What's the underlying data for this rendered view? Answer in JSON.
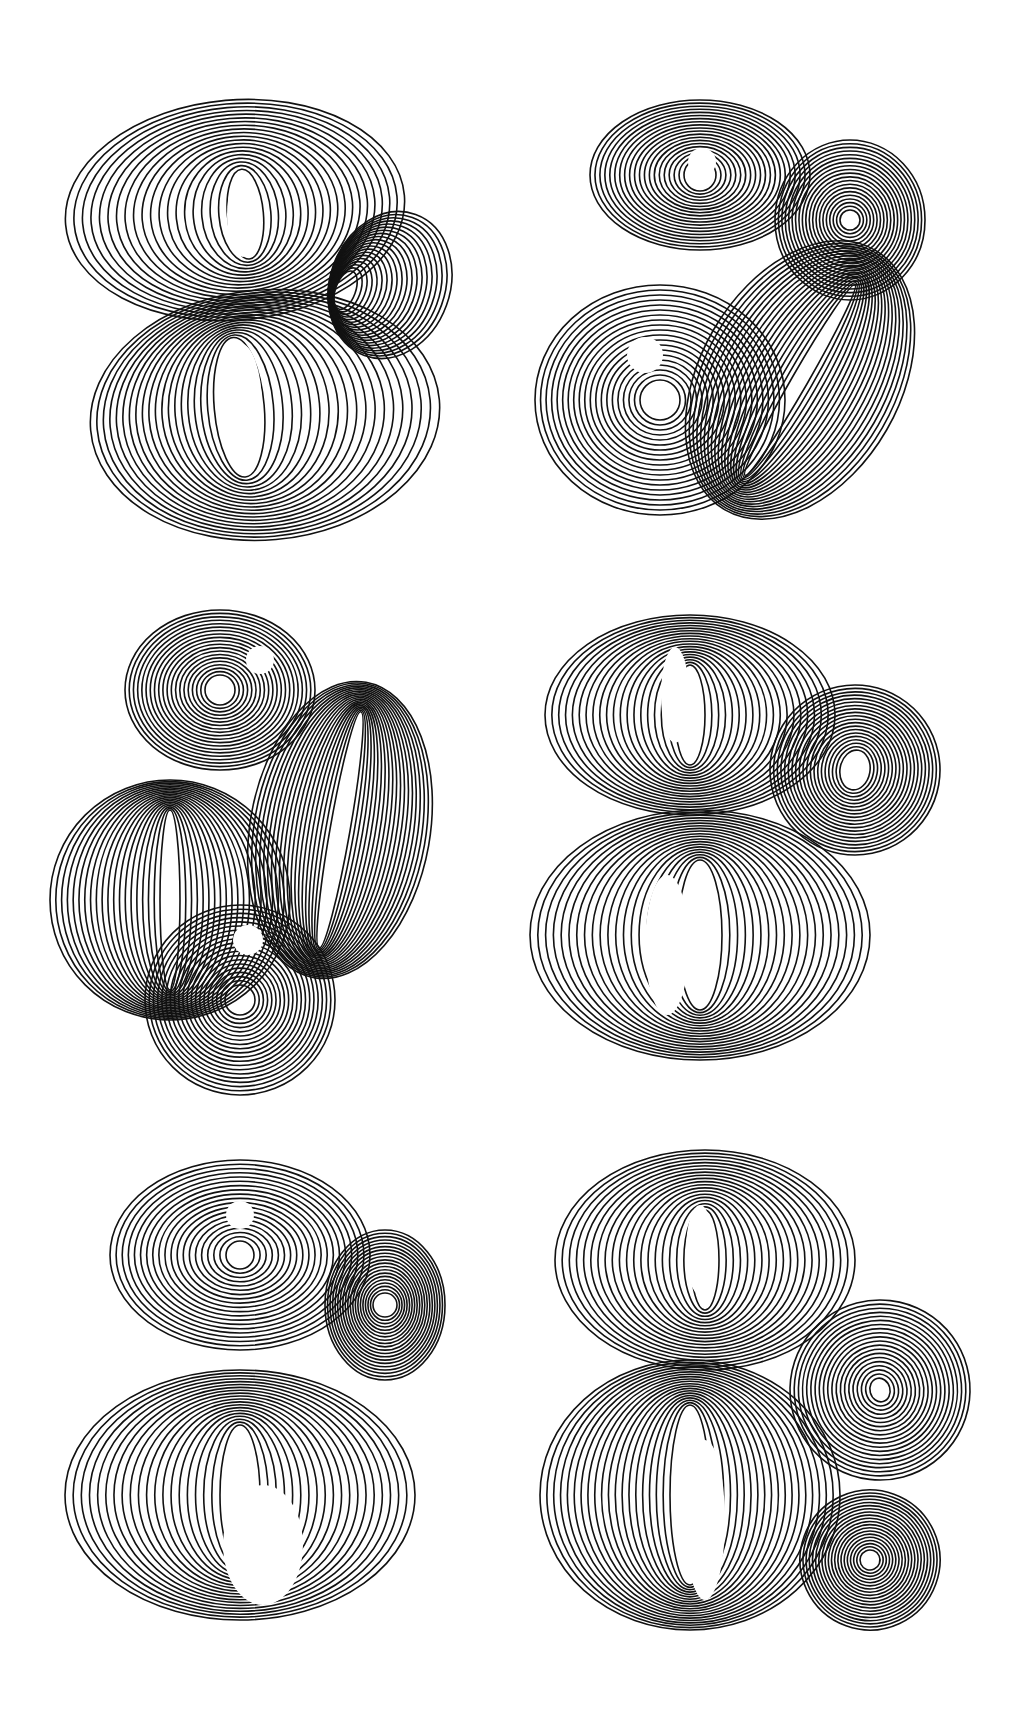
{
  "artwork": {
    "subject": "Six ampersand glyphs drawn with concentric line strokes",
    "background": "#ffffff",
    "ink": "#111111",
    "line_count": 20,
    "glyphs": [
      {
        "name": "ampersand-1",
        "position": "top-left",
        "x": 60,
        "y": 85,
        "w": 400,
        "h": 460
      },
      {
        "name": "ampersand-2",
        "position": "top-right",
        "x": 520,
        "y": 90,
        "w": 440,
        "h": 450
      },
      {
        "name": "ampersand-3",
        "position": "middle-left",
        "x": 40,
        "y": 600,
        "w": 430,
        "h": 500
      },
      {
        "name": "ampersand-4",
        "position": "middle-right",
        "x": 525,
        "y": 605,
        "w": 430,
        "h": 460
      },
      {
        "name": "ampersand-5",
        "position": "bottom-left",
        "x": 55,
        "y": 1145,
        "w": 410,
        "h": 480
      },
      {
        "name": "ampersand-6",
        "position": "bottom-right",
        "x": 530,
        "y": 1140,
        "w": 440,
        "h": 510
      }
    ]
  }
}
